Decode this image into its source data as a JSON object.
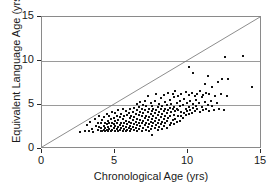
{
  "chart_data": {
    "type": "scatter",
    "title": "",
    "xlabel": "Chronological Age (yrs)",
    "ylabel": "Equivalent Language Age (yrs)",
    "xlim": [
      0,
      15
    ],
    "ylim": [
      0,
      15
    ],
    "xticks": [
      0,
      5,
      10,
      15
    ],
    "yticks": [
      0,
      5,
      10,
      15
    ],
    "xtick_labels": [
      "0",
      "5",
      "10",
      "15"
    ],
    "ytick_labels": [
      "0",
      "5",
      "10",
      "15"
    ],
    "grid": "horizontal gridlines at y = 5, 10, 15",
    "legend": "none",
    "marker": "small filled black square",
    "annotations": [
      {
        "name": "identity-line",
        "description": "diagonal reference line y = x from (0,0) to (15,15)",
        "x": [
          0,
          15
        ],
        "y": [
          0,
          15
        ]
      }
    ],
    "series": [
      {
        "name": "participants",
        "marker_color": "#121212",
        "points": [
          [
            2.6,
            1.9
          ],
          [
            2.9,
            2.0
          ],
          [
            3.1,
            2.7
          ],
          [
            3.2,
            2.1
          ],
          [
            3.3,
            3.1
          ],
          [
            3.4,
            2.3
          ],
          [
            3.5,
            1.9
          ],
          [
            3.6,
            3.4
          ],
          [
            3.7,
            2.6
          ],
          [
            3.8,
            2.2
          ],
          [
            3.8,
            3.0
          ],
          [
            3.9,
            2.5
          ],
          [
            3.9,
            3.8
          ],
          [
            4.0,
            2.0
          ],
          [
            4.0,
            2.4
          ],
          [
            4.0,
            2.9
          ],
          [
            4.1,
            2.1
          ],
          [
            4.1,
            3.3
          ],
          [
            4.2,
            2.2
          ],
          [
            4.2,
            2.6
          ],
          [
            4.2,
            3.6
          ],
          [
            4.3,
            2.0
          ],
          [
            4.3,
            2.4
          ],
          [
            4.3,
            3.0
          ],
          [
            4.4,
            2.2
          ],
          [
            4.4,
            2.8
          ],
          [
            4.4,
            4.0
          ],
          [
            4.5,
            2.1
          ],
          [
            4.5,
            2.5
          ],
          [
            4.5,
            3.2
          ],
          [
            4.6,
            2.3
          ],
          [
            4.6,
            2.9
          ],
          [
            4.6,
            3.7
          ],
          [
            4.7,
            2.0
          ],
          [
            4.7,
            2.6
          ],
          [
            4.7,
            3.4
          ],
          [
            4.8,
            2.2
          ],
          [
            4.8,
            3.0
          ],
          [
            4.8,
            4.2
          ],
          [
            4.9,
            2.4
          ],
          [
            4.9,
            2.8
          ],
          [
            4.9,
            3.5
          ],
          [
            5.0,
            2.1
          ],
          [
            5.0,
            2.6
          ],
          [
            5.0,
            3.2
          ],
          [
            5.0,
            4.1
          ],
          [
            5.1,
            2.3
          ],
          [
            5.1,
            2.9
          ],
          [
            5.1,
            3.8
          ],
          [
            5.2,
            2.0
          ],
          [
            5.2,
            2.5
          ],
          [
            5.2,
            3.3
          ],
          [
            5.2,
            4.4
          ],
          [
            5.3,
            2.2
          ],
          [
            5.3,
            2.7
          ],
          [
            5.3,
            3.6
          ],
          [
            5.4,
            2.4
          ],
          [
            5.4,
            3.0
          ],
          [
            5.4,
            4.0
          ],
          [
            5.5,
            2.1
          ],
          [
            5.5,
            2.6
          ],
          [
            5.5,
            3.4
          ],
          [
            5.5,
            4.6
          ],
          [
            5.6,
            2.3
          ],
          [
            5.6,
            2.9
          ],
          [
            5.6,
            3.7
          ],
          [
            5.7,
            2.0
          ],
          [
            5.7,
            2.5
          ],
          [
            5.7,
            3.2
          ],
          [
            5.7,
            4.3
          ],
          [
            5.8,
            2.2
          ],
          [
            5.8,
            2.8
          ],
          [
            5.8,
            3.9
          ],
          [
            5.9,
            2.4
          ],
          [
            5.9,
            3.1
          ],
          [
            5.9,
            4.1
          ],
          [
            6.0,
            2.1
          ],
          [
            6.0,
            2.6
          ],
          [
            6.0,
            3.5
          ],
          [
            6.0,
            4.5
          ],
          [
            6.1,
            2.3
          ],
          [
            6.1,
            3.0
          ],
          [
            6.1,
            3.8
          ],
          [
            6.2,
            2.5
          ],
          [
            6.2,
            3.3
          ],
          [
            6.2,
            4.2
          ],
          [
            6.3,
            2.2
          ],
          [
            6.3,
            2.8
          ],
          [
            6.3,
            3.6
          ],
          [
            6.3,
            4.7
          ],
          [
            6.4,
            2.4
          ],
          [
            6.4,
            3.1
          ],
          [
            6.4,
            4.0
          ],
          [
            6.5,
            2.0
          ],
          [
            6.5,
            2.7
          ],
          [
            6.5,
            3.4
          ],
          [
            6.5,
            4.4
          ],
          [
            6.5,
            5.1
          ],
          [
            6.6,
            2.3
          ],
          [
            6.6,
            3.0
          ],
          [
            6.6,
            3.9
          ],
          [
            6.6,
            4.8
          ],
          [
            6.7,
            2.6
          ],
          [
            6.7,
            3.3
          ],
          [
            6.7,
            4.2
          ],
          [
            6.7,
            5.3
          ],
          [
            6.8,
            2.1
          ],
          [
            6.8,
            2.9
          ],
          [
            6.8,
            3.7
          ],
          [
            6.8,
            4.6
          ],
          [
            6.9,
            2.4
          ],
          [
            6.9,
            3.2
          ],
          [
            6.9,
            4.1
          ],
          [
            6.9,
            5.0
          ],
          [
            7.0,
            2.7
          ],
          [
            7.0,
            3.5
          ],
          [
            7.0,
            4.4
          ],
          [
            7.0,
            5.5
          ],
          [
            7.1,
            2.2
          ],
          [
            7.1,
            3.0
          ],
          [
            7.1,
            3.8
          ],
          [
            7.1,
            4.9
          ],
          [
            7.2,
            2.5
          ],
          [
            7.2,
            3.3
          ],
          [
            7.2,
            4.2
          ],
          [
            7.2,
            6.0
          ],
          [
            7.3,
            2.0
          ],
          [
            7.3,
            2.8
          ],
          [
            7.3,
            3.6
          ],
          [
            7.3,
            4.5
          ],
          [
            7.4,
            2.3
          ],
          [
            7.4,
            3.1
          ],
          [
            7.4,
            4.0
          ],
          [
            7.4,
            5.2
          ],
          [
            7.5,
            1.6
          ],
          [
            7.5,
            2.6
          ],
          [
            7.5,
            3.4
          ],
          [
            7.5,
            4.3
          ],
          [
            7.5,
            4.9
          ],
          [
            7.6,
            2.9
          ],
          [
            7.6,
            3.7
          ],
          [
            7.6,
            4.6
          ],
          [
            7.7,
            2.4
          ],
          [
            7.7,
            3.2
          ],
          [
            7.7,
            4.1
          ],
          [
            7.7,
            5.4
          ],
          [
            7.8,
            2.7
          ],
          [
            7.8,
            3.5
          ],
          [
            7.8,
            4.4
          ],
          [
            7.8,
            6.3
          ],
          [
            7.9,
            2.2
          ],
          [
            7.9,
            3.0
          ],
          [
            7.9,
            3.9
          ],
          [
            7.9,
            4.8
          ],
          [
            8.0,
            2.5
          ],
          [
            8.0,
            3.3
          ],
          [
            8.0,
            4.2
          ],
          [
            8.0,
            5.1
          ],
          [
            8.1,
            2.8
          ],
          [
            8.1,
            3.6
          ],
          [
            8.1,
            4.5
          ],
          [
            8.1,
            5.8
          ],
          [
            8.2,
            2.3
          ],
          [
            8.2,
            3.1
          ],
          [
            8.2,
            4.0
          ],
          [
            8.2,
            4.9
          ],
          [
            8.3,
            2.6
          ],
          [
            8.3,
            3.4
          ],
          [
            8.3,
            4.3
          ],
          [
            8.3,
            6.1
          ],
          [
            8.4,
            2.9
          ],
          [
            8.4,
            3.7
          ],
          [
            8.4,
            4.6
          ],
          [
            8.4,
            5.3
          ],
          [
            8.5,
            2.4
          ],
          [
            8.5,
            3.2
          ],
          [
            8.5,
            4.1
          ],
          [
            8.5,
            5.0
          ],
          [
            8.6,
            3.5
          ],
          [
            8.6,
            4.4
          ],
          [
            8.6,
            6.4
          ],
          [
            8.7,
            2.7
          ],
          [
            8.7,
            3.8
          ],
          [
            8.7,
            4.7
          ],
          [
            8.7,
            5.6
          ],
          [
            8.8,
            3.0
          ],
          [
            8.8,
            4.2
          ],
          [
            8.8,
            5.1
          ],
          [
            8.9,
            3.3
          ],
          [
            8.9,
            4.5
          ],
          [
            8.9,
            6.2
          ],
          [
            9.0,
            2.8
          ],
          [
            9.0,
            3.9
          ],
          [
            9.0,
            4.8
          ],
          [
            9.0,
            5.9
          ],
          [
            9.1,
            3.4
          ],
          [
            9.1,
            4.3
          ],
          [
            9.1,
            6.6
          ],
          [
            9.2,
            3.1
          ],
          [
            9.2,
            4.6
          ],
          [
            9.2,
            5.2
          ],
          [
            9.3,
            3.7
          ],
          [
            9.3,
            4.4
          ],
          [
            9.3,
            6.0
          ],
          [
            9.4,
            3.2
          ],
          [
            9.4,
            4.9
          ],
          [
            9.4,
            5.5
          ],
          [
            9.5,
            3.8
          ],
          [
            9.5,
            4.2
          ],
          [
            9.5,
            6.3
          ],
          [
            9.6,
            3.5
          ],
          [
            9.6,
            5.0
          ],
          [
            9.7,
            4.1
          ],
          [
            9.7,
            5.7
          ],
          [
            9.8,
            3.9
          ],
          [
            9.8,
            4.6
          ],
          [
            9.8,
            6.5
          ],
          [
            9.9,
            4.3
          ],
          [
            9.9,
            5.2
          ],
          [
            10.0,
            4.0
          ],
          [
            10.0,
            4.8
          ],
          [
            10.0,
            6.1
          ],
          [
            10.0,
            9.3
          ],
          [
            10.1,
            4.4
          ],
          [
            10.1,
            5.4
          ],
          [
            10.2,
            4.1
          ],
          [
            10.2,
            6.4
          ],
          [
            10.3,
            4.7
          ],
          [
            10.3,
            5.1
          ],
          [
            10.3,
            8.6
          ],
          [
            10.4,
            4.3
          ],
          [
            10.4,
            6.0
          ],
          [
            10.5,
            4.9
          ],
          [
            10.5,
            5.6
          ],
          [
            10.6,
            4.5
          ],
          [
            10.6,
            6.3
          ],
          [
            10.7,
            5.2
          ],
          [
            10.8,
            4.2
          ],
          [
            10.8,
            6.6
          ],
          [
            10.9,
            4.8
          ],
          [
            10.9,
            5.9
          ],
          [
            11.0,
            4.4
          ],
          [
            11.0,
            6.1
          ],
          [
            11.1,
            5.3
          ],
          [
            11.1,
            7.4
          ],
          [
            11.2,
            4.6
          ],
          [
            11.2,
            6.4
          ],
          [
            11.3,
            5.0
          ],
          [
            11.3,
            8.3
          ],
          [
            11.4,
            4.3
          ],
          [
            11.4,
            6.2
          ],
          [
            11.5,
            5.5
          ],
          [
            11.6,
            4.9
          ],
          [
            11.6,
            7.0
          ],
          [
            11.7,
            4.4
          ],
          [
            11.8,
            6.0
          ],
          [
            11.9,
            5.2
          ],
          [
            12.0,
            7.6
          ],
          [
            12.1,
            4.6
          ],
          [
            12.2,
            6.3
          ],
          [
            12.3,
            7.9
          ],
          [
            12.4,
            4.4
          ],
          [
            12.5,
            10.4
          ],
          [
            12.6,
            6.0
          ],
          [
            12.7,
            8.0
          ],
          [
            13.7,
            10.6
          ],
          [
            14.3,
            7.0
          ]
        ]
      }
    ]
  },
  "axes": {
    "x_title": "Chronological Age (yrs)",
    "y_title": "Equivalent Language Age (yrs)",
    "x_tick_labels": [
      "0",
      "5",
      "10",
      "15"
    ],
    "y_tick_labels": [
      "0",
      "5",
      "10",
      "15"
    ]
  },
  "colors": {
    "marker": "#121212",
    "grid": "#9a9a9a",
    "frame": "#8a8a8a",
    "reference_line": "#6f6f6f",
    "text": "#1a1a1a",
    "background": "#ffffff"
  }
}
